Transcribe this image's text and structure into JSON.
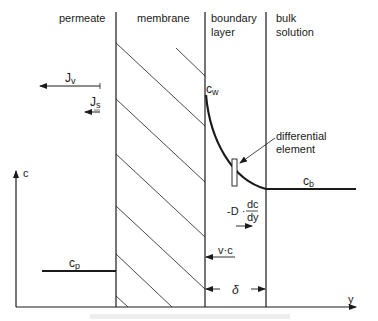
{
  "diagram": {
    "regions": {
      "permeate": "permeate",
      "membrane": "membrane",
      "boundary_line1": "boundary",
      "boundary_line2": "layer",
      "bulk_line1": "bulk",
      "bulk_line2": "solution"
    },
    "fluxes": {
      "jv_main": "J",
      "jv_sub": "v",
      "js_main": "J",
      "js_sub": "s"
    },
    "concentrations": {
      "cw_main": "c",
      "cw_sub": "w",
      "cb_main": "c",
      "cb_sub": "b",
      "cp_main": "c",
      "cp_sub": "p"
    },
    "annotations": {
      "differential_line1": "differential",
      "differential_line2": "element",
      "diffusion_prefix": "-D ·",
      "diffusion_num": "dc",
      "diffusion_den": "dy",
      "convection": "v·c",
      "thickness": "δ"
    },
    "axes": {
      "y_axis_label": "c",
      "x_axis_label": "y"
    },
    "colors": {
      "ink": "#1a1a1a",
      "background": "#ffffff"
    }
  }
}
